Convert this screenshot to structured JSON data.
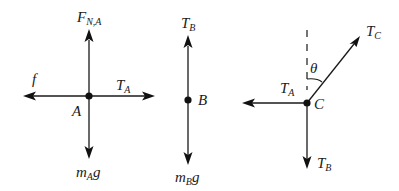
{
  "diagram": {
    "bodies": [
      {
        "point_label": "A",
        "forces": [
          {
            "direction": "up",
            "label": "F",
            "subscript": "N,A"
          },
          {
            "direction": "down",
            "label": "m",
            "subscript": "A",
            "suffix": "g"
          },
          {
            "direction": "left",
            "label": "f",
            "subscript": ""
          },
          {
            "direction": "right",
            "label": "T",
            "subscript": "A"
          }
        ]
      },
      {
        "point_label": "B",
        "forces": [
          {
            "direction": "up",
            "label": "T",
            "subscript": "B"
          },
          {
            "direction": "down",
            "label": "m",
            "subscript": "B",
            "suffix": "g"
          }
        ]
      },
      {
        "point_label": "C",
        "forces": [
          {
            "direction": "left",
            "label": "T",
            "subscript": "A"
          },
          {
            "direction": "down",
            "label": "T",
            "subscript": "B"
          },
          {
            "direction": "up-right (angle θ from vertical)",
            "label": "T",
            "subscript": "C"
          }
        ],
        "angle_label": "θ",
        "reference_line": "vertical dashed"
      }
    ]
  }
}
